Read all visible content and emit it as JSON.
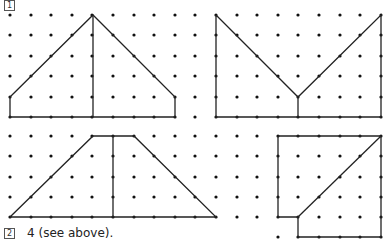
{
  "question_numbers": {
    "q1": "1",
    "q2": "2"
  },
  "answer_text": "4 (see above).",
  "grid": {
    "x0": 10,
    "dx": 20.6,
    "cols": 19,
    "top_rows_y": [
      15,
      35,
      56,
      76,
      97,
      117
    ],
    "bottom_rows_y": [
      136,
      156,
      177,
      197,
      217,
      237
    ],
    "dot_color": "#111111",
    "line_color": "#222222"
  },
  "figures": [
    {
      "name": "house-split",
      "polylines": [
        [
          [
            10,
            97
          ],
          [
            93,
            15
          ],
          [
            175,
            97
          ],
          [
            175,
            117
          ],
          [
            10,
            117
          ],
          [
            10,
            97
          ]
        ],
        [
          [
            93,
            15
          ],
          [
            93,
            117
          ]
        ]
      ]
    },
    {
      "name": "v-shape",
      "polylines": [
        [
          [
            216,
            15
          ],
          [
            298,
            97
          ],
          [
            381,
            15
          ],
          [
            381,
            117
          ],
          [
            216,
            117
          ],
          [
            216,
            15
          ]
        ],
        [
          [
            298,
            97
          ],
          [
            298,
            117
          ]
        ]
      ]
    },
    {
      "name": "trapezoid-split",
      "polylines": [
        [
          [
            10,
            217
          ],
          [
            93,
            136
          ],
          [
            134,
            136
          ],
          [
            216,
            217
          ],
          [
            10,
            217
          ]
        ],
        [
          [
            113,
            136
          ],
          [
            113,
            217
          ]
        ]
      ]
    },
    {
      "name": "square-notch",
      "polylines": [
        [
          [
            278,
            136
          ],
          [
            381,
            136
          ],
          [
            381,
            237
          ],
          [
            298,
            237
          ],
          [
            298,
            217
          ],
          [
            278,
            217
          ],
          [
            278,
            136
          ]
        ],
        [
          [
            298,
            217
          ],
          [
            381,
            136
          ]
        ]
      ]
    }
  ]
}
